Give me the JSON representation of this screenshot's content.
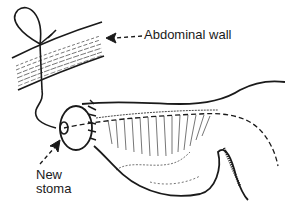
{
  "diagram": {
    "type": "medical-illustration",
    "labels": {
      "abdominal_wall": "Abdominal wall",
      "new_stoma_line1": "New",
      "new_stoma_line2": "stoma"
    },
    "colors": {
      "ink": "#1a1a1a",
      "background": "#ffffff"
    }
  }
}
